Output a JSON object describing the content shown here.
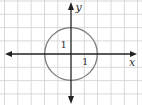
{
  "diagram": {
    "type": "coordinate-plane-circle",
    "axes": {
      "x_label": "x",
      "y_label": "y"
    },
    "grid": {
      "spacing_px": 13.35,
      "origin_px": [
        71,
        54
      ],
      "color": "#c8c8c8"
    },
    "circle": {
      "center": [
        0,
        0
      ],
      "radius_units": 2,
      "stroke": "#7a7a7a"
    },
    "labels": [
      {
        "text": "1",
        "note": "inside circle, upper-left of origin"
      },
      {
        "text": "1",
        "note": "inside circle, lower-right of origin"
      }
    ],
    "colors": {
      "axis": "#222222",
      "grid": "#c8c8c8",
      "circle": "#7a7a7a",
      "background": "#ffffff"
    }
  }
}
